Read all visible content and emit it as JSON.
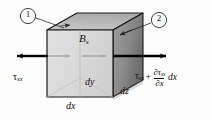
{
  "figure": {
    "type": "3d-cube-free-body-diagram"
  },
  "labels": {
    "body_force": {
      "symbol": "B",
      "subscript": "x"
    },
    "stress_left": {
      "symbol": "τ",
      "subscript": "xx"
    },
    "stress_right": {
      "base_symbol": "τ",
      "base_subscript": "xx",
      "plus": "+",
      "numerator_partial": "∂τ",
      "numerator_subscript": "xx",
      "denominator_partial": "∂x",
      "trailing": "dx"
    },
    "dim_dx": "dx",
    "dim_dy": "dy",
    "dim_dz": "dz",
    "callout_1": "1",
    "callout_2": "2"
  },
  "colors": {
    "front_face": "#dcdcdc",
    "top_face": "#b8b8b8",
    "right_face": "#8e8e8e",
    "right_face_dark": "#6f6f6f",
    "outline": "#1a1a1a",
    "arrow": "#000000",
    "interior_arrow": "#a9a9a9",
    "leader": "#3a3a3a",
    "background": "#fdfdfd"
  },
  "geometry": {
    "front_face_corners": "(47,30) (113,30) (113,97) (47,97)",
    "depth_offset_x": 30,
    "depth_offset_y": -17
  }
}
